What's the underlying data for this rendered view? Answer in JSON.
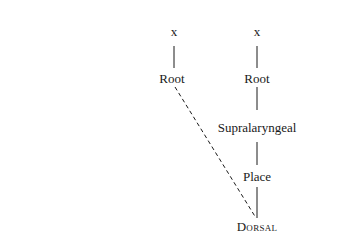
{
  "diagram": {
    "type": "feature-geometry-tree",
    "left_tree": {
      "nodes": [
        {
          "id": "x_left",
          "label": "x"
        },
        {
          "id": "root_left",
          "label": "Root"
        }
      ]
    },
    "right_tree": {
      "nodes": [
        {
          "id": "x_right",
          "label": "x"
        },
        {
          "id": "root_right",
          "label": "Root"
        },
        {
          "id": "supralaryngeal",
          "label": "Supralaryngeal"
        },
        {
          "id": "place",
          "label": "Place"
        },
        {
          "id": "dorsal",
          "label": "Dorsal"
        }
      ]
    },
    "edges": [
      {
        "from": "x_left",
        "to": "root_left",
        "style": "solid"
      },
      {
        "from": "x_right",
        "to": "root_right",
        "style": "solid"
      },
      {
        "from": "root_right",
        "to": "supralaryngeal",
        "style": "solid"
      },
      {
        "from": "supralaryngeal",
        "to": "place",
        "style": "solid"
      },
      {
        "from": "place",
        "to": "dorsal",
        "style": "solid"
      },
      {
        "from": "root_left",
        "to": "dorsal",
        "style": "dashed"
      }
    ]
  }
}
